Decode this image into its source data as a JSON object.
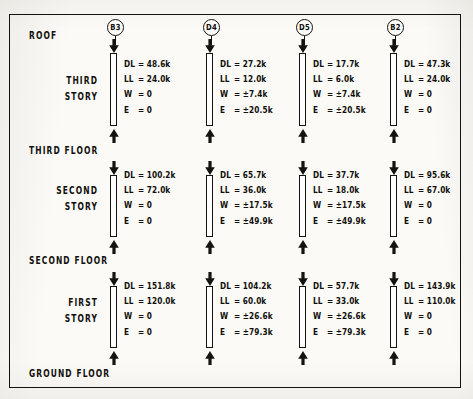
{
  "figure": {
    "type": "structural-column-load-diagram",
    "levels": [
      {
        "id": "roof",
        "label": "ROOF"
      },
      {
        "id": "third-floor",
        "label": "THIRD FLOOR"
      },
      {
        "id": "second-floor",
        "label": "SECOND FLOOR"
      },
      {
        "id": "ground-floor",
        "label": "GROUND FLOOR"
      }
    ],
    "stories": [
      {
        "id": "third-story",
        "label": "THIRD\nSTORY"
      },
      {
        "id": "second-story",
        "label": "SECOND\nSTORY"
      },
      {
        "id": "first-story",
        "label": "FIRST\nSTORY"
      }
    ],
    "columns": [
      {
        "id": "b3",
        "mark": "B3"
      },
      {
        "id": "d4",
        "mark": "D4"
      },
      {
        "id": "d5",
        "mark": "D5"
      },
      {
        "id": "b2",
        "mark": "B2"
      }
    ],
    "load_keys": [
      "DL",
      "LL",
      "W",
      "E"
    ],
    "equals": "=",
    "loads": {
      "third-story": {
        "b3": {
          "DL": "48.6k",
          "LL": "24.0k",
          "W": "0",
          "E": "0"
        },
        "d4": {
          "DL": "27.2k",
          "LL": "12.0k",
          "W": "±7.4k",
          "E": "±20.5k"
        },
        "d5": {
          "DL": "17.7k",
          "LL": "6.0k",
          "W": "±7.4k",
          "E": "±20.5k"
        },
        "b2": {
          "DL": "47.3k",
          "LL": "24.0k",
          "W": "0",
          "E": "0"
        }
      },
      "second-story": {
        "b3": {
          "DL": "100.2k",
          "LL": "72.0k",
          "W": "0",
          "E": "0"
        },
        "d4": {
          "DL": "65.7k",
          "LL": "36.0k",
          "W": "±17.5k",
          "E": "±49.9k"
        },
        "d5": {
          "DL": "37.7k",
          "LL": "18.0k",
          "W": "±17.5k",
          "E": "±49.9k"
        },
        "b2": {
          "DL": "95.6k",
          "LL": "67.0k",
          "W": "0",
          "E": "0"
        }
      },
      "first-story": {
        "b3": {
          "DL": "151.8k",
          "LL": "120.0k",
          "W": "0",
          "E": "0"
        },
        "d4": {
          "DL": "104.2k",
          "LL": "60.0k",
          "W": "±26.6k",
          "E": "±79.3k"
        },
        "d5": {
          "DL": "57.7k",
          "LL": "33.0k",
          "W": "±26.6k",
          "E": "±79.3k"
        },
        "b2": {
          "DL": "143.9k",
          "LL": "110.0k",
          "W": "0",
          "E": "0"
        }
      }
    },
    "colors": {
      "ink": "#110f0c",
      "paper": "#fbfaf7",
      "member_fill": "#ffffff"
    }
  }
}
